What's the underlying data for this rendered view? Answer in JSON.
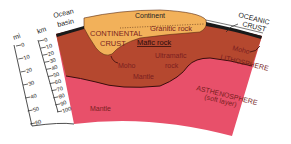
{
  "diagram": {
    "colors": {
      "continental_crust": "#f2b15a",
      "lithosphere_mantle": "#b5482f",
      "asthenosphere": "#e8506a",
      "oceanic_crust": "#1a1a1a",
      "background": "#ffffff"
    },
    "labels": {
      "ocean_basin_line1": "Ocean",
      "ocean_basin_line2": "basin",
      "continent": "Continent",
      "continental_crust_line1": "CONTINENTAL",
      "continental_crust_line2": "CRUST",
      "granitic_rock": "Granitic rock",
      "mafic_rock": "Mafic rock",
      "ultramafic_line1": "Ultramafic",
      "ultramafic_line2": "rock",
      "moho_left": "Moho",
      "moho_right": "Moho",
      "mantle_upper": "Mantle",
      "mantle_lower": "Mantle",
      "oceanic_crust_line1": "OCEANIC",
      "oceanic_crust_line2": "CRUST",
      "lithosphere": "LITHOSPHERE",
      "asthenosphere_line1": "ASTHENOSPHERE",
      "asthenosphere_line2": "(soft layer)"
    },
    "scales": {
      "mi": {
        "unit": "mi",
        "ticks": [
          "0",
          "10",
          "20",
          "30",
          "40",
          "50",
          "60"
        ]
      },
      "km": {
        "unit": "km",
        "ticks": [
          "0",
          "10",
          "20",
          "30",
          "40",
          "50",
          "60",
          "70",
          "80",
          "90",
          "100"
        ]
      }
    }
  }
}
